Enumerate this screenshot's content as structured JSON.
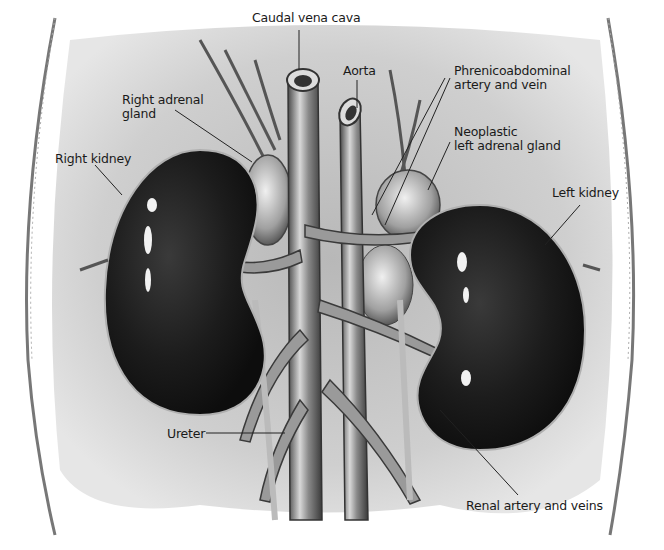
{
  "figure": {
    "labels": {
      "caudal_vena_cava": "Caudal vena cava",
      "aorta": "Aorta",
      "phrenicoabdominal_line1": "Phrenicoabdominal",
      "phrenicoabdominal_line2": "artery and vein",
      "right_adrenal_line1": "Right adrenal",
      "right_adrenal_line2": "gland",
      "neoplastic_line1": "Neoplastic",
      "neoplastic_line2": "left adrenal gland",
      "right_kidney": "Right kidney",
      "left_kidney": "Left kidney",
      "ureter": "Ureter",
      "renal_vessels": "Renal artery and veins"
    },
    "colors": {
      "background_wash": "#c8c8c8",
      "kidney": "#1e1e1e",
      "vessel": "#9a9a9a",
      "leader_line": "#222222"
    }
  }
}
